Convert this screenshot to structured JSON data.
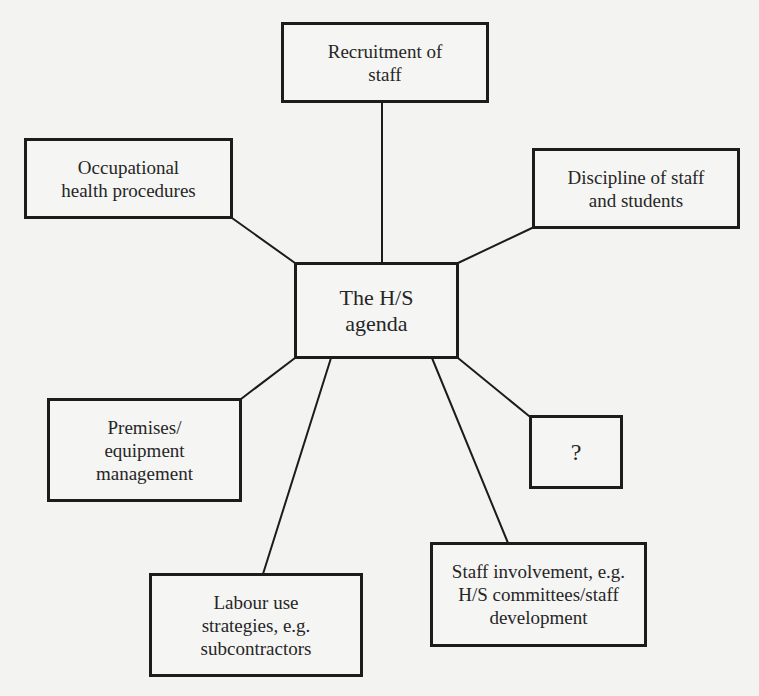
{
  "diagram": {
    "type": "hub-and-spoke",
    "center": {
      "id": "hs-agenda",
      "label": "The H/S\nagenda"
    },
    "nodes": [
      {
        "id": "recruitment",
        "label": "Recruitment of\nstaff"
      },
      {
        "id": "occupational-health",
        "label": "Occupational\nhealth procedures"
      },
      {
        "id": "discipline",
        "label": "Discipline of staff\nand students"
      },
      {
        "id": "premises",
        "label": "Premises/\nequipment\nmanagement"
      },
      {
        "id": "unknown",
        "label": "?"
      },
      {
        "id": "labour-use",
        "label": "Labour use\nstrategies, e.g.\nsubcontractors"
      },
      {
        "id": "staff-involvement",
        "label": "Staff involvement, e.g.\nH/S committees/staff\ndevelopment"
      }
    ],
    "edges": [
      {
        "from": "hs-agenda",
        "to": "recruitment"
      },
      {
        "from": "hs-agenda",
        "to": "occupational-health"
      },
      {
        "from": "hs-agenda",
        "to": "discipline"
      },
      {
        "from": "hs-agenda",
        "to": "premises"
      },
      {
        "from": "hs-agenda",
        "to": "unknown"
      },
      {
        "from": "hs-agenda",
        "to": "labour-use"
      },
      {
        "from": "hs-agenda",
        "to": "staff-involvement"
      }
    ]
  },
  "colors": {
    "background": "#f3f3f2",
    "stroke": "#1c1c1c",
    "text": "#262626"
  }
}
